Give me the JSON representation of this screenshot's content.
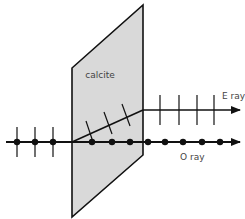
{
  "diagram": {
    "crystal": {
      "label": "calcite",
      "fill": "#d9d9d9",
      "stroke": "#111111",
      "points": [
        [
          72,
          68
        ],
        [
          143,
          5
        ],
        [
          143,
          155
        ],
        [
          72,
          217
        ]
      ]
    },
    "incident_ray": {
      "y": 142,
      "x_start": 6,
      "dots_x": [
        17,
        35,
        53
      ],
      "ticks_half": 15
    },
    "o_ray": {
      "label": "O ray",
      "y": 142,
      "x_end": 240,
      "dots_x": [
        92,
        112,
        130,
        148,
        165,
        183,
        202,
        220
      ]
    },
    "e_ray": {
      "label": "E ray",
      "entry": [
        72,
        142
      ],
      "exit": [
        143,
        110
      ],
      "y": 110,
      "x_end": 240,
      "ticks_x": [
        160,
        179,
        197,
        214
      ],
      "ticks_half": 15,
      "inner_ticks": [
        [
          [
            86,
            121
          ],
          [
            93,
            142
          ]
        ],
        [
          [
            104,
            112
          ],
          [
            112,
            134
          ]
        ],
        [
          [
            122,
            104
          ],
          [
            130,
            126
          ]
        ]
      ]
    },
    "colors": {
      "line": "#111111",
      "label": "#444444",
      "background": "#ffffff"
    }
  }
}
